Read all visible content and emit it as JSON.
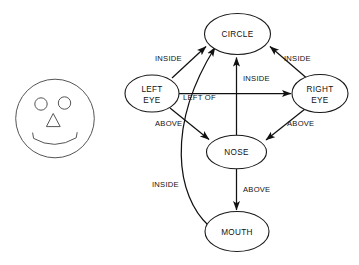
{
  "figure": {
    "background_color": "#ffffff",
    "stroke_color": "#111111",
    "face_stroke_color": "#555555"
  },
  "face_drawing": {
    "name": "smiley-face-drawing",
    "parts": [
      {
        "name": "face-outline",
        "shape": "circle"
      },
      {
        "name": "left-eye",
        "shape": "circle"
      },
      {
        "name": "right-eye",
        "shape": "circle"
      },
      {
        "name": "nose",
        "shape": "triangle"
      },
      {
        "name": "mouth",
        "shape": "arc"
      }
    ]
  },
  "graph": {
    "nodes": [
      {
        "id": "circle",
        "label": "CIRCLE"
      },
      {
        "id": "left_eye",
        "label": "LEFT\nEYE",
        "line1": "LEFT",
        "line2": "EYE"
      },
      {
        "id": "right_eye",
        "label": "RIGHT\nEYE",
        "line1": "RIGHT",
        "line2": "EYE"
      },
      {
        "id": "nose",
        "label": "NOSE"
      },
      {
        "id": "mouth",
        "label": "MOUTH"
      }
    ],
    "edges": [
      {
        "id": "e1",
        "from": "left_eye",
        "to": "circle",
        "label": "INSIDE"
      },
      {
        "id": "e2",
        "from": "right_eye",
        "to": "circle",
        "label": "INSIDE"
      },
      {
        "id": "e3",
        "from": "nose",
        "to": "circle",
        "label": "INSIDE"
      },
      {
        "id": "e4",
        "from": "mouth",
        "to": "circle",
        "label": "INSIDE"
      },
      {
        "id": "e5",
        "from": "left_eye",
        "to": "right_eye",
        "label": "LEFT OF"
      },
      {
        "id": "e6",
        "from": "left_eye",
        "to": "nose",
        "label": "ABOVE"
      },
      {
        "id": "e7",
        "from": "right_eye",
        "to": "nose",
        "label": "ABOVE"
      },
      {
        "id": "e8",
        "from": "nose",
        "to": "mouth",
        "label": "ABOVE"
      }
    ],
    "labels": {
      "inside_left": "INSIDE",
      "inside_right": "INSIDE",
      "inside_center": "INSIDE",
      "inside_mouth": "INSIDE",
      "left_of": "LEFT OF",
      "above_left": "ABOVE",
      "above_right": "ABOVE",
      "above_nose_mouth": "ABOVE"
    },
    "node_text": {
      "circle": "CIRCLE",
      "left_eye_1": "LEFT",
      "left_eye_2": "EYE",
      "right_eye_1": "RIGHT",
      "right_eye_2": "EYE",
      "nose": "NOSE",
      "mouth": "MOUTH"
    }
  }
}
